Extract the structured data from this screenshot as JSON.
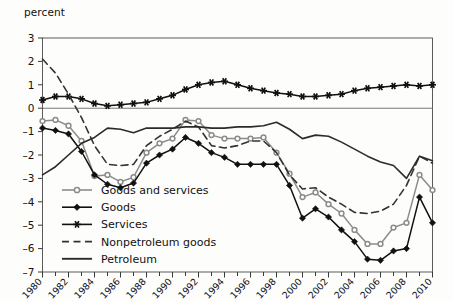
{
  "chart_data": {
    "type": "line",
    "title": "",
    "ylabel": "percent",
    "xlabel": "",
    "ylim": [
      -7,
      3
    ],
    "y_ticks": [
      3,
      2,
      1,
      0,
      -1,
      -2,
      -3,
      -4,
      -5,
      -6,
      -7
    ],
    "y_tick_labels": [
      "3",
      "2",
      "1",
      "0",
      "–1",
      "–2",
      "–3",
      "–4",
      "–5",
      "–6",
      "–7"
    ],
    "xlim": [
      1980,
      2010
    ],
    "x": [
      1980,
      1981,
      1982,
      1983,
      1984,
      1985,
      1986,
      1987,
      1988,
      1989,
      1990,
      1991,
      1992,
      1993,
      1994,
      1995,
      1996,
      1997,
      1998,
      1999,
      2000,
      2001,
      2002,
      2003,
      2004,
      2005,
      2006,
      2007,
      2008,
      2009,
      2010
    ],
    "x_ticks": [
      1980,
      1982,
      1984,
      1986,
      1988,
      1990,
      1992,
      1994,
      1996,
      1998,
      2000,
      2002,
      2004,
      2006,
      2008,
      2010
    ],
    "x_tick_labels": [
      "1980",
      "1982",
      "1984",
      "1986",
      "1988",
      "1990",
      "1992",
      "1994",
      "1996",
      "1998",
      "2000",
      "2002",
      "2004",
      "2006",
      "2008",
      "2010"
    ],
    "grid": false,
    "zero_line": true,
    "legend_position": "inside-lower-left",
    "series": [
      {
        "name": "Goods and services",
        "marker": "circle",
        "color": "#8c8c8c",
        "dash": "none",
        "values": [
          -0.55,
          -0.5,
          -0.75,
          -1.4,
          -2.9,
          -2.85,
          -3.15,
          -2.95,
          -1.9,
          -1.5,
          -1.3,
          -0.5,
          -0.55,
          -1.15,
          -1.3,
          -1.3,
          -1.3,
          -1.25,
          -1.9,
          -2.8,
          -3.8,
          -3.6,
          -4.1,
          -4.5,
          -5.2,
          -5.8,
          -5.8,
          -5.1,
          -4.9,
          -2.85,
          -3.5
        ]
      },
      {
        "name": "Goods",
        "marker": "diamond",
        "color": "#111111",
        "dash": "none",
        "values": [
          -0.85,
          -0.95,
          -1.1,
          -1.85,
          -2.85,
          -3.25,
          -3.4,
          -3.2,
          -2.35,
          -2.0,
          -1.75,
          -1.25,
          -1.5,
          -1.9,
          -2.1,
          -2.4,
          -2.4,
          -2.4,
          -2.4,
          -3.3,
          -4.7,
          -4.3,
          -4.65,
          -5.2,
          -5.7,
          -6.45,
          -6.5,
          -6.1,
          -6.0,
          -3.8,
          -4.9
        ]
      },
      {
        "name": "Services",
        "marker": "star",
        "color": "#111111",
        "dash": "none",
        "values": [
          0.35,
          0.5,
          0.5,
          0.4,
          0.2,
          0.1,
          0.15,
          0.2,
          0.25,
          0.4,
          0.55,
          0.8,
          1.0,
          1.1,
          1.15,
          1.0,
          0.85,
          0.75,
          0.65,
          0.6,
          0.5,
          0.5,
          0.55,
          0.6,
          0.75,
          0.85,
          0.9,
          0.95,
          1.0,
          0.95,
          1.0
        ]
      },
      {
        "name": "Nonpetroleum goods",
        "marker": "none",
        "color": "#333333",
        "dash": "dashed",
        "values": [
          2.1,
          1.5,
          0.6,
          -0.4,
          -1.6,
          -2.4,
          -2.45,
          -2.4,
          -1.6,
          -1.2,
          -0.9,
          -0.55,
          -0.8,
          -1.6,
          -1.7,
          -1.6,
          -1.4,
          -1.4,
          -1.9,
          -2.85,
          -3.45,
          -3.4,
          -3.8,
          -4.1,
          -4.45,
          -4.5,
          -4.4,
          -4.1,
          -3.3,
          -2.05,
          -2.35
        ]
      },
      {
        "name": "Petroleum",
        "marker": "none",
        "color": "#2b2b2b",
        "dash": "none",
        "values": [
          -2.85,
          -2.5,
          -2.0,
          -1.5,
          -1.25,
          -0.85,
          -0.9,
          -1.05,
          -0.85,
          -0.85,
          -0.85,
          -0.8,
          -0.8,
          -0.85,
          -0.85,
          -0.8,
          -0.8,
          -0.75,
          -0.6,
          -0.9,
          -1.3,
          -1.15,
          -1.2,
          -1.45,
          -1.75,
          -2.05,
          -2.3,
          -2.45,
          -3.0,
          -2.05,
          -2.25
        ]
      }
    ]
  },
  "legend": {
    "items": [
      {
        "label": "Goods and services"
      },
      {
        "label": "Goods"
      },
      {
        "label": "Services"
      },
      {
        "label": "Nonpetroleum goods"
      },
      {
        "label": "Petroleum"
      }
    ]
  }
}
